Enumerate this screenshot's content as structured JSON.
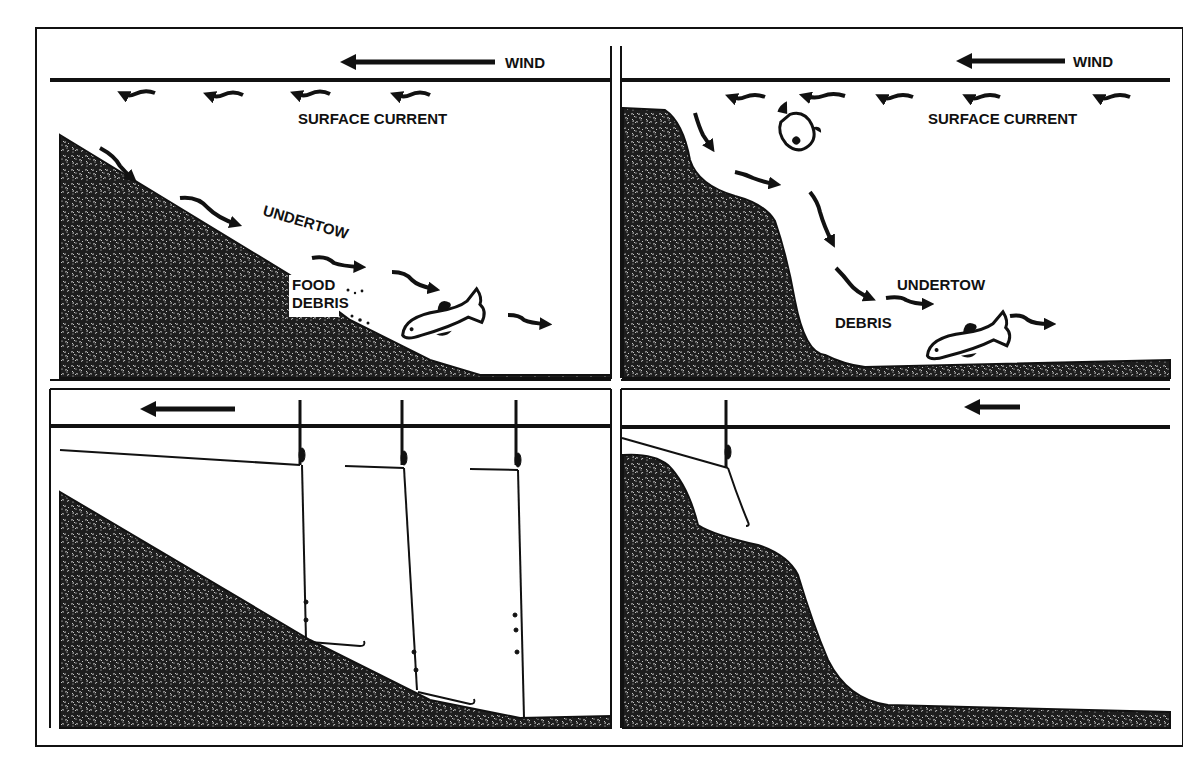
{
  "figure": {
    "colors": {
      "ink": "#111111",
      "ground_fill": "#1e1e1e",
      "ground_speckle": "#ffffff",
      "paper": "#ffffff"
    },
    "panels": [
      {
        "id": "top-left",
        "bottom_profile": "gradual-slope",
        "labels": {
          "wind": "WIND",
          "surface_current": "SURFACE CURRENT",
          "undertow": "UNDERTOW",
          "food_debris_line1": "FOOD",
          "food_debris_line2": "DEBRIS"
        },
        "icons": [
          "wind-arrow",
          "surface-current-arrows",
          "undertow-arrows",
          "fish"
        ]
      },
      {
        "id": "top-right",
        "bottom_profile": "steep-drop-off",
        "labels": {
          "wind": "WIND",
          "surface_current": "SURFACE CURRENT",
          "undertow": "UNDERTOW",
          "debris": "DEBRIS"
        },
        "icons": [
          "wind-arrow",
          "surface-current-arrows",
          "undertow-arrows",
          "fish",
          "fish-diving"
        ]
      },
      {
        "id": "bottom-left",
        "bottom_profile": "gradual-slope",
        "labels": {},
        "icons": [
          "wind-arrow",
          "float-rig",
          "float-rig",
          "float-rig"
        ],
        "rig_count": 3
      },
      {
        "id": "bottom-right",
        "bottom_profile": "steep-drop-off",
        "labels": {},
        "icons": [
          "wind-arrow",
          "float-rig"
        ],
        "rig_count": 1
      }
    ]
  }
}
